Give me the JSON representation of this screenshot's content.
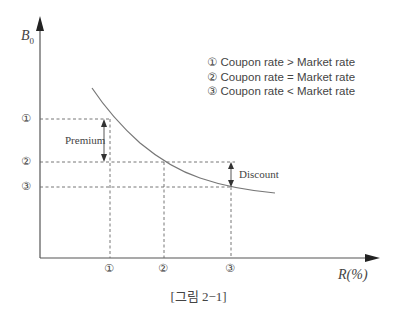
{
  "figure": {
    "y_axis_label": "B",
    "y_axis_sub": "0",
    "x_axis_label": "R(%)",
    "caption": "[그림 2−1]",
    "y_levels": [
      "①",
      "②",
      "③"
    ],
    "x_ticks": [
      "①",
      "②",
      "③"
    ],
    "premium_label": "Premium",
    "discount_label": "Discount",
    "legend": [
      "① Coupon rate > Market rate",
      "② Coupon rate = Market rate",
      "③ Coupon rate < Market rate"
    ],
    "colors": {
      "line": "#555555",
      "curve": "#777777",
      "text": "#444444"
    }
  }
}
